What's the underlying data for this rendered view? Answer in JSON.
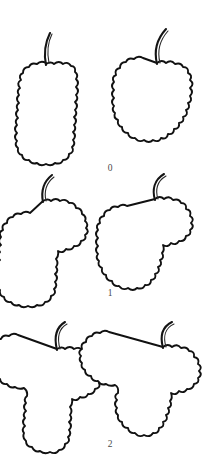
{
  "figure": {
    "background_color": "#ffffff",
    "line_color": "#111111",
    "label_color": "#4a4a4a",
    "width": 221,
    "height": 473,
    "rows": [
      {
        "class_label": "0",
        "label_x": 110,
        "label_y": 171,
        "shape_name": "cylindrical",
        "drawings": [
          {
            "position": "left",
            "name": "bunch-cylindrical-left",
            "stem_path": "M46 65 C 44 55, 44 45, 50 33",
            "stem_path_inner": "M49 63 C 47 53, 47 44, 52 34",
            "body_path": "M46 64 q5 -3 8 0 q5 -4 9 0 q5 -3 8 2 q5 0 4 6 q4 3 1 7 q4 4 0 8 q4 4 0 8 q3 4 -1 7 q4 4 0 8 q3 4 -1 7 q4 4 0 8 q3 4 -1 7 q4 4 0 8 q3 4 -1 7 q3 5 -3 7 q0 6 -6 6 q-2 5 -8 3 q-4 4 -9 1 q-5 3 -9 -1 q-5 2 -8 -3 q-6 1 -7 -5 q-5 -1 -4 -7 q-4 -3 -1 -7 q-4 -4 0 -8 q-4 -4 0 -8 q-3 -4 1 -7 q-4 -4 0 -8 q-3 -4 1 -7 q-4 -4 0 -8 q-3 -4 1 -7 q-4 -5 1 -8 q-3 -5 2 -7 q0 -6 6 -6 q2 -5 8 -3 q4 -4 9 -1 Z"
          },
          {
            "position": "right",
            "name": "bunch-conical-right",
            "stem_path": "M157 64 C 154 52, 156 40, 166 29",
            "stem_path_inner": "M160 63 C 157 51, 159 41, 168 31",
            "body_path": "M157 63 q5 -4 9 0 q5 -4 9 1 q6 -2 8 3 q6 0 5 6 q5 2 2 7 q5 4 0 8 q4 4 0 8 q3 5 -2 7 q3 5 -2 7 q3 5 -3 7 q2 5 -4 6 q1 6 -5 6 q0 6 -6 5 q-1 6 -7 4 q-2 5 -8 2 q-4 4 -9 0 q-5 3 -9 -2 q-6 1 -7 -5 q-6 0 -6 -6 q-5 -1 -4 -7 q-5 -2 -3 -7 q-4 -3 -1 -7 q-4 -4 0 -8 q-4 -4 0 -8 q-4 -4 0 -8 q-3 -5 2 -7 q-2 -6 4 -7 q0 -6 6 -6 q2 -5 8 -3 q4 -4 9 -1 Z"
          }
        ]
      },
      {
        "class_label": "1",
        "label_x": 110,
        "label_y": 296,
        "shape_name": "cylindrical-winged",
        "drawings": [
          {
            "position": "left",
            "name": "bunch-winged-cylindrical-left",
            "stem_path": "M43 202 C 41 192, 42 183, 52 175",
            "stem_path_inner": "M46 201 C 44 192, 45 184, 54 177",
            "body_path": "M43 201 q5 -3 8 0 q5 -4 9 0 q6 -3 9 2 q6 -1 7 5 q6 0 6 6 q5 2 3 7 q4 3 1 7 q4 4 -1 7 q2 5 -4 6 q-1 6 -7 5 q-2 5 -8 3 q-3 5 -8 2 q1 5 -2 8 q3 4 0 8 q3 4 -1 7 q4 4 0 8 q3 4 -1 7 q3 5 -3 7 q0 6 -6 6 q-2 5 -8 3 q-4 4 -9 1 q-5 3 -9 -1 q-5 2 -8 -3 q-6 1 -7 -5 q-5 -1 -4 -7 q-4 -3 -1 -7 q-4 -4 0 -8 q-4 -4 0 -8 q-3 -4 1 -7 q-4 -4 0 -8 q-3 -4 1 -7 q-4 -4 0 -8 q-3 -5 2 -7 q-2 -6 4 -7 q0 -6 6 -6 q2 -5 8 -3 q4 -4 9 -1 Z"
          },
          {
            "position": "right",
            "name": "bunch-winged-conical-right",
            "stem_path": "M155 200 C 152 190, 154 180, 164 174",
            "stem_path_inner": "M158 199 C 155 190, 157 181, 166 176",
            "body_path": "M155 199 q5 -4 9 0 q5 -4 9 1 q6 -2 8 3 q6 0 5 6 q6 1 4 7 q5 3 1 7 q4 4 -1 7 q2 5 -4 6 q-1 6 -7 5 q-3 5 -8 2 q-3 5 -8 2 q2 5 -1 8 q3 5 -2 7 q3 5 -2 7 q3 5 -3 7 q2 5 -4 6 q0 6 -6 5 q-2 5 -8 3 q-4 4 -9 0 q-5 3 -9 -2 q-6 1 -7 -5 q-6 0 -6 -6 q-5 -1 -4 -7 q-5 -2 -3 -7 q-4 -3 -1 -7 q-4 -4 0 -8 q-4 -4 0 -8 q-4 -4 0 -8 q-3 -5 2 -7 q-2 -6 4 -7 q0 -6 6 -6 q2 -5 8 -3 q4 -4 9 -1 Z"
          }
        ]
      },
      {
        "class_label": "2",
        "label_x": 110,
        "label_y": 447,
        "shape_name": "strongly-winged",
        "drawings": [
          {
            "position": "left",
            "name": "bunch-double-winged-cylindrical-left",
            "stem_path": "M57 350 C 54 338, 55 328, 65 322",
            "stem_path_inner": "M60 349 C 57 338, 58 329, 67 324",
            "body_path": "M57 349 q5 -3 8 0 q5 -4 9 0 q6 -3 9 2 q6 -1 7 5 q6 0 6 6 q5 2 3 7 q4 3 1 7 q4 4 -1 7 q2 5 -4 6 q-1 6 -7 5 q-2 5 -8 3 q-3 5 -8 2 q1 5 -2 8 q3 4 0 8 q3 4 -1 7 q4 4 0 8 q3 4 -1 7 q3 5 -3 7 q0 6 -6 6 q-3 5 -9 2 q-5 3 -10 -1 q-5 2 -8 -4 q-6 0 -6 -6 q-4 -3 -2 -8 q-3 -4 1 -7 q-4 -4 0 -8 q-3 -4 1 -7 q-4 -4 0 -8 q-3 -4 1 -7 q1 -5 -3 -8 q-5 2 -9 -1 q-5 2 -8 -3 q-6 1 -7 -5 q-6 0 -6 -6 q-5 -2 -3 -7 q-4 -3 -1 -7 q-4 -4 1 -7 q-2 -6 4 -7 q0 -6 6 -6 q2 -5 8 -3 q4 -4 9 -1 Z"
          },
          {
            "position": "right",
            "name": "bunch-double-winged-conical-right",
            "stem_path": "M163 348 C 160 337, 162 327, 172 322",
            "stem_path_inner": "M166 347 C 163 337, 165 328, 174 324",
            "body_path": "M163 347 q5 -4 9 0 q5 -4 9 1 q6 -2 8 3 q6 0 5 6 q6 1 4 7 q5 3 1 7 q4 4 -1 7 q2 5 -4 6 q-1 6 -7 5 q-3 5 -8 2 q-3 5 -8 2 q2 5 -1 8 q3 5 -2 7 q3 5 -2 7 q3 5 -3 7 q2 5 -4 6 q0 6 -6 5 q-3 5 -9 2 q-5 3 -9 -2 q-6 1 -7 -5 q-6 0 -6 -6 q-5 -1 -4 -7 q-4 -3 -1 -7 q-4 -4 0 -8 q-4 -4 1 -7 q1 -6 -3 -8 q-5 2 -9 -1 q-5 2 -8 -3 q-6 1 -7 -5 q-6 0 -6 -6 q-5 -2 -3 -7 q-4 -3 -1 -7 q-4 -4 1 -7 q-2 -6 4 -7 q0 -6 6 -6 q2 -5 8 -3 q4 -4 9 -1 Z"
          }
        ]
      }
    ]
  }
}
